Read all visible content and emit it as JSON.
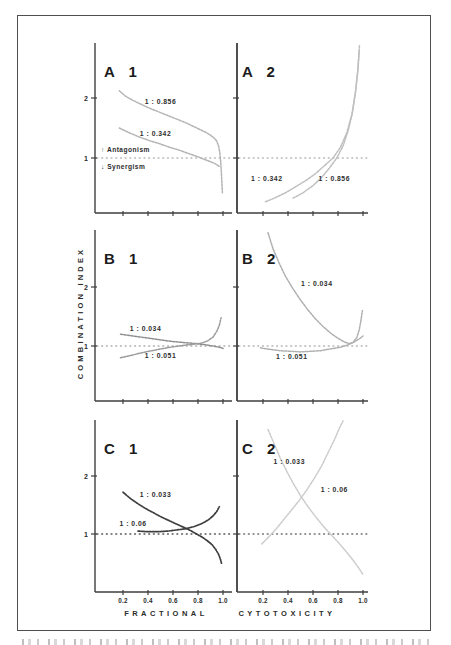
{
  "page": {
    "background": "#ffffff",
    "border_color": "#4f4f4f"
  },
  "axes": {
    "y_label": "COMBINATION INDEX",
    "x_label_left": "FRACTIONAL",
    "x_label_right": "CYTOTOXICITY",
    "x_tick_values": [
      0.2,
      0.4,
      0.6,
      0.8,
      1.0
    ],
    "x_tick_labels": [
      "0.2",
      "0.4",
      "0.6",
      "0.8",
      "1.0"
    ],
    "y_tick_values": [
      1,
      2
    ],
    "y_tick_labels": [
      "1",
      "2"
    ],
    "reference_line_y": 1,
    "xlim": [
      0,
      1.05
    ],
    "ylim": [
      0.08,
      2.95
    ],
    "grid": "off",
    "axis_color": "#3e3e3e"
  },
  "annotations": {
    "antagonism_arrow": "↑",
    "antagonism": "Antagonism",
    "synergism_arrow": "↓",
    "synergism": "Synergism"
  },
  "chart_data": [
    {
      "id": "A1",
      "type": "line",
      "panel_label": "A 1",
      "row": "A",
      "col": "left",
      "show_y_numerals": true,
      "show_x_numerals": false,
      "show_annotations": true,
      "ref_line_color": "#b8b8b8",
      "series": [
        {
          "label": "1 : 0.856",
          "color": "#b4b4b4",
          "label_xy": [
            0.5,
            1.9
          ],
          "points": [
            [
              0.17,
              2.12
            ],
            [
              0.22,
              2.03
            ],
            [
              0.28,
              1.96
            ],
            [
              0.34,
              1.9
            ],
            [
              0.4,
              1.84
            ],
            [
              0.46,
              1.79
            ],
            [
              0.52,
              1.74
            ],
            [
              0.58,
              1.69
            ],
            [
              0.64,
              1.64
            ],
            [
              0.7,
              1.59
            ],
            [
              0.76,
              1.53
            ],
            [
              0.82,
              1.47
            ],
            [
              0.86,
              1.43
            ],
            [
              0.9,
              1.38
            ],
            [
              0.93,
              1.33
            ],
            [
              0.95,
              1.28
            ],
            [
              0.965,
              1.2
            ],
            [
              0.975,
              1.08
            ],
            [
              0.982,
              0.92
            ],
            [
              0.988,
              0.72
            ],
            [
              0.992,
              0.55
            ],
            [
              0.995,
              0.42
            ]
          ]
        },
        {
          "label": "1 : 0.342",
          "color": "#b4b4b4",
          "label_xy": [
            0.46,
            1.36
          ],
          "points": [
            [
              0.17,
              1.5
            ],
            [
              0.25,
              1.42
            ],
            [
              0.33,
              1.35
            ],
            [
              0.41,
              1.29
            ],
            [
              0.49,
              1.24
            ],
            [
              0.57,
              1.18
            ],
            [
              0.65,
              1.13
            ],
            [
              0.73,
              1.07
            ],
            [
              0.8,
              1.02
            ],
            [
              0.86,
              0.97
            ],
            [
              0.91,
              0.93
            ],
            [
              0.95,
              0.89
            ],
            [
              0.97,
              0.86
            ]
          ]
        }
      ]
    },
    {
      "id": "A2",
      "type": "line",
      "panel_label": "A 2",
      "row": "A",
      "col": "right",
      "show_y_numerals": false,
      "show_x_numerals": false,
      "show_annotations": false,
      "ref_line_color": "#b8b8b8",
      "series": [
        {
          "label": "1 : 0.342",
          "color": "#bfbfbf",
          "label_xy": [
            0.23,
            0.62
          ],
          "points": [
            [
              0.22,
              0.27
            ],
            [
              0.3,
              0.34
            ],
            [
              0.38,
              0.42
            ],
            [
              0.46,
              0.52
            ],
            [
              0.54,
              0.62
            ],
            [
              0.62,
              0.74
            ],
            [
              0.69,
              0.87
            ],
            [
              0.76,
              1.0
            ],
            [
              0.82,
              1.18
            ],
            [
              0.87,
              1.42
            ],
            [
              0.91,
              1.72
            ],
            [
              0.94,
              2.1
            ],
            [
              0.96,
              2.5
            ],
            [
              0.972,
              2.88
            ]
          ]
        },
        {
          "label": "1 : 0.856",
          "color": "#bfbfbf",
          "label_xy": [
            0.77,
            0.62
          ],
          "points": [
            [
              0.44,
              0.33
            ],
            [
              0.52,
              0.42
            ],
            [
              0.6,
              0.54
            ],
            [
              0.67,
              0.68
            ],
            [
              0.73,
              0.83
            ],
            [
              0.79,
              1.0
            ],
            [
              0.84,
              1.2
            ],
            [
              0.88,
              1.45
            ],
            [
              0.915,
              1.75
            ],
            [
              0.94,
              2.1
            ],
            [
              0.958,
              2.45
            ],
            [
              0.97,
              2.8
            ]
          ]
        }
      ]
    },
    {
      "id": "B1",
      "type": "line",
      "panel_label": "B 1",
      "row": "B",
      "col": "left",
      "show_y_numerals": true,
      "show_x_numerals": false,
      "show_annotations": false,
      "ref_line_color": "#aeaeae",
      "series": [
        {
          "label": "1 : 0.034",
          "color": "#8f8f8f",
          "label_xy": [
            0.38,
            1.25
          ],
          "points": [
            [
              0.18,
              1.2
            ],
            [
              0.28,
              1.17
            ],
            [
              0.38,
              1.14
            ],
            [
              0.48,
              1.11
            ],
            [
              0.58,
              1.08
            ],
            [
              0.68,
              1.06
            ],
            [
              0.78,
              1.04
            ],
            [
              0.86,
              1.02
            ],
            [
              0.92,
              1.0
            ],
            [
              0.97,
              0.98
            ],
            [
              1.0,
              0.96
            ]
          ]
        },
        {
          "label": "1 : 0.051",
          "color": "#9b9b9b",
          "label_xy": [
            0.5,
            0.79
          ],
          "points": [
            [
              0.18,
              0.8
            ],
            [
              0.28,
              0.85
            ],
            [
              0.38,
              0.9
            ],
            [
              0.48,
              0.94
            ],
            [
              0.58,
              0.98
            ],
            [
              0.68,
              1.01
            ],
            [
              0.76,
              1.03
            ],
            [
              0.83,
              1.05
            ],
            [
              0.88,
              1.09
            ],
            [
              0.92,
              1.15
            ],
            [
              0.95,
              1.25
            ],
            [
              0.97,
              1.35
            ],
            [
              0.985,
              1.48
            ]
          ]
        }
      ]
    },
    {
      "id": "B2",
      "type": "line",
      "panel_label": "B 2",
      "row": "B",
      "col": "right",
      "show_y_numerals": false,
      "show_x_numerals": false,
      "show_annotations": false,
      "ref_line_color": "#b4b4b4",
      "series": [
        {
          "label": "1 : 0.034",
          "color": "#b0b0b0",
          "label_xy": [
            0.63,
            2.02
          ],
          "points": [
            [
              0.24,
              2.92
            ],
            [
              0.28,
              2.65
            ],
            [
              0.33,
              2.4
            ],
            [
              0.38,
              2.18
            ],
            [
              0.44,
              1.97
            ],
            [
              0.5,
              1.78
            ],
            [
              0.56,
              1.61
            ],
            [
              0.62,
              1.46
            ],
            [
              0.68,
              1.33
            ],
            [
              0.74,
              1.22
            ],
            [
              0.8,
              1.13
            ],
            [
              0.85,
              1.07
            ],
            [
              0.89,
              1.04
            ],
            [
              0.92,
              1.06
            ],
            [
              0.95,
              1.14
            ],
            [
              0.97,
              1.28
            ],
            [
              0.985,
              1.45
            ],
            [
              0.995,
              1.6
            ]
          ]
        },
        {
          "label": "1 : 0.051",
          "color": "#b0b0b0",
          "label_xy": [
            0.43,
            0.78
          ],
          "points": [
            [
              0.18,
              0.97
            ],
            [
              0.26,
              0.94
            ],
            [
              0.34,
              0.92
            ],
            [
              0.42,
              0.91
            ],
            [
              0.5,
              0.9
            ],
            [
              0.58,
              0.91
            ],
            [
              0.66,
              0.92
            ],
            [
              0.74,
              0.95
            ],
            [
              0.82,
              0.98
            ],
            [
              0.88,
              1.02
            ],
            [
              0.93,
              1.07
            ],
            [
              0.97,
              1.12
            ],
            [
              1.0,
              1.17
            ]
          ]
        }
      ]
    },
    {
      "id": "C1",
      "type": "line",
      "panel_label": "C 1",
      "row": "C",
      "col": "left",
      "show_y_numerals": true,
      "show_x_numerals": true,
      "show_annotations": false,
      "ref_line_color": "#555555",
      "series": [
        {
          "label": "1 : 0.033",
          "color": "#3e3e3e",
          "label_xy": [
            0.46,
            1.63
          ],
          "points": [
            [
              0.2,
              1.72
            ],
            [
              0.26,
              1.61
            ],
            [
              0.32,
              1.52
            ],
            [
              0.38,
              1.44
            ],
            [
              0.44,
              1.37
            ],
            [
              0.5,
              1.3
            ],
            [
              0.56,
              1.24
            ],
            [
              0.62,
              1.18
            ],
            [
              0.68,
              1.12
            ],
            [
              0.73,
              1.07
            ],
            [
              0.78,
              1.01
            ],
            [
              0.83,
              0.95
            ],
            [
              0.87,
              0.89
            ],
            [
              0.91,
              0.82
            ],
            [
              0.94,
              0.74
            ],
            [
              0.965,
              0.65
            ],
            [
              0.98,
              0.56
            ],
            [
              0.99,
              0.48
            ]
          ]
        },
        {
          "label": "1 : 0.06",
          "color": "#3e3e3e",
          "label_xy": [
            0.28,
            1.13
          ],
          "points": [
            [
              0.32,
              1.05
            ],
            [
              0.4,
              1.04
            ],
            [
              0.48,
              1.04
            ],
            [
              0.56,
              1.05
            ],
            [
              0.63,
              1.07
            ],
            [
              0.7,
              1.09
            ],
            [
              0.77,
              1.13
            ],
            [
              0.83,
              1.18
            ],
            [
              0.88,
              1.24
            ],
            [
              0.92,
              1.31
            ],
            [
              0.95,
              1.39
            ],
            [
              0.97,
              1.47
            ]
          ]
        }
      ]
    },
    {
      "id": "C2",
      "type": "line",
      "panel_label": "C 2",
      "row": "C",
      "col": "right",
      "show_y_numerals": false,
      "show_x_numerals": true,
      "show_annotations": false,
      "ref_line_color": "#6e6e6e",
      "series": [
        {
          "label": "1 : 0.033",
          "color": "#cccccc",
          "label_xy": [
            0.41,
            2.2
          ],
          "points": [
            [
              0.24,
              2.8
            ],
            [
              0.29,
              2.55
            ],
            [
              0.34,
              2.3
            ],
            [
              0.39,
              2.08
            ],
            [
              0.44,
              1.88
            ],
            [
              0.5,
              1.66
            ],
            [
              0.56,
              1.47
            ],
            [
              0.62,
              1.3
            ],
            [
              0.68,
              1.14
            ],
            [
              0.74,
              1.0
            ],
            [
              0.8,
              0.86
            ],
            [
              0.86,
              0.71
            ],
            [
              0.92,
              0.55
            ],
            [
              0.97,
              0.4
            ],
            [
              1.0,
              0.3
            ]
          ]
        },
        {
          "label": "1 : 0.06",
          "color": "#cccccc",
          "label_xy": [
            0.77,
            1.73
          ],
          "points": [
            [
              0.19,
              0.83
            ],
            [
              0.25,
              0.96
            ],
            [
              0.31,
              1.1
            ],
            [
              0.37,
              1.26
            ],
            [
              0.43,
              1.42
            ],
            [
              0.49,
              1.58
            ],
            [
              0.55,
              1.76
            ],
            [
              0.61,
              1.96
            ],
            [
              0.67,
              2.18
            ],
            [
              0.72,
              2.4
            ],
            [
              0.77,
              2.62
            ],
            [
              0.81,
              2.82
            ],
            [
              0.84,
              2.95
            ]
          ]
        }
      ]
    }
  ]
}
